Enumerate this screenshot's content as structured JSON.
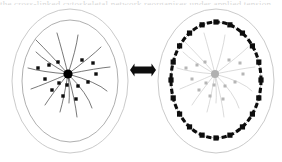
{
  "figure": {
    "caption_sliver": "the cross-linked cytoskeletal network reorganises under applied tension",
    "arrow": {
      "name": "bidirectional-arrow",
      "label": "reversible transition",
      "direction": "both",
      "cx": 143,
      "cy": 70,
      "length": 26,
      "thickness": 7
    },
    "colors": {
      "background": "#ffffff",
      "outline": "#9a9a9a",
      "outline_faint": "#bdbdbd",
      "node": "#0d0d0d",
      "node_faded": "#b6b6b6",
      "spoke": "#4c4c4c",
      "spoke_faded": "#cfcfcf",
      "ring": "#0d0d0d",
      "arrow": "#0d0d0d"
    },
    "panels": [
      {
        "id": "panel-left",
        "name": "centralized-state-panel",
        "state_label": "centralized",
        "outer_ellipse": {
          "cx": 70,
          "cy": 81,
          "rx": 58,
          "ry": 72
        },
        "inner_ellipse": {
          "cx": 70,
          "cy": 81,
          "rx": 48,
          "ry": 61
        },
        "hub": {
          "cx": 68,
          "cy": 74,
          "r": 4.6,
          "faded": false
        },
        "node_size": 3.4,
        "node_faded": false,
        "spoke_faded": false,
        "nodes": [
          {
            "x": 38,
            "y": 68
          },
          {
            "x": 49,
            "y": 65
          },
          {
            "x": 58,
            "y": 62
          },
          {
            "x": 82,
            "y": 60
          },
          {
            "x": 93,
            "y": 63
          },
          {
            "x": 96,
            "y": 74
          },
          {
            "x": 88,
            "y": 82
          },
          {
            "x": 78,
            "y": 86
          },
          {
            "x": 67,
            "y": 85
          },
          {
            "x": 59,
            "y": 83
          },
          {
            "x": 52,
            "y": 90
          },
          {
            "x": 63,
            "y": 96
          },
          {
            "x": 76,
            "y": 99
          },
          {
            "x": 45,
            "y": 79
          }
        ],
        "spokes": [
          {
            "x1": 68,
            "y1": 74,
            "cx": 50,
            "cy": 54,
            "x2": 36,
            "y2": 40
          },
          {
            "x1": 68,
            "y1": 74,
            "cx": 62,
            "cy": 50,
            "x2": 57,
            "y2": 33
          },
          {
            "x1": 68,
            "y1": 74,
            "cx": 76,
            "cy": 50,
            "x2": 78,
            "y2": 35
          },
          {
            "x1": 68,
            "y1": 74,
            "cx": 92,
            "cy": 56,
            "x2": 101,
            "y2": 47
          },
          {
            "x1": 68,
            "y1": 74,
            "cx": 98,
            "cy": 68,
            "x2": 110,
            "y2": 67
          },
          {
            "x1": 68,
            "y1": 74,
            "cx": 97,
            "cy": 82,
            "x2": 107,
            "y2": 91
          },
          {
            "x1": 68,
            "y1": 74,
            "cx": 88,
            "cy": 94,
            "x2": 92,
            "y2": 108
          },
          {
            "x1": 68,
            "y1": 74,
            "cx": 75,
            "cy": 100,
            "x2": 77,
            "y2": 117
          },
          {
            "x1": 68,
            "y1": 74,
            "cx": 64,
            "cy": 98,
            "x2": 60,
            "y2": 112
          },
          {
            "x1": 68,
            "y1": 74,
            "cx": 52,
            "cy": 94,
            "x2": 45,
            "y2": 105
          },
          {
            "x1": 68,
            "y1": 74,
            "cx": 45,
            "cy": 84,
            "x2": 31,
            "y2": 89
          },
          {
            "x1": 68,
            "y1": 74,
            "cx": 42,
            "cy": 72,
            "x2": 28,
            "y2": 68
          },
          {
            "x1": 68,
            "y1": 74,
            "cx": 46,
            "cy": 62,
            "x2": 36,
            "y2": 52
          },
          {
            "x1": 68,
            "y1": 74,
            "cx": 70,
            "cy": 92,
            "x2": 69,
            "y2": 103
          }
        ]
      },
      {
        "id": "panel-right",
        "name": "cortical-ring-state-panel",
        "state_label": "peripheral ring",
        "outer_ellipse": {
          "cx": 216,
          "cy": 81,
          "rx": 58,
          "ry": 72
        },
        "inner_ellipse": {
          "cx": 216,
          "cy": 80,
          "rx": 45,
          "ry": 58
        },
        "hub": {
          "cx": 215,
          "cy": 74,
          "r": 4.0,
          "faded": true
        },
        "node_size": 3.0,
        "node_faded": true,
        "spoke_faded": true,
        "ring": {
          "cx": 216,
          "cy": 80,
          "rx": 45,
          "ry": 58,
          "node_count": 20,
          "node_size": 5.2
        },
        "nodes": [
          {
            "x": 186,
            "y": 68
          },
          {
            "x": 197,
            "y": 65
          },
          {
            "x": 205,
            "y": 62
          },
          {
            "x": 229,
            "y": 60
          },
          {
            "x": 240,
            "y": 63
          },
          {
            "x": 243,
            "y": 74
          },
          {
            "x": 235,
            "y": 82
          },
          {
            "x": 225,
            "y": 86
          },
          {
            "x": 214,
            "y": 85
          },
          {
            "x": 206,
            "y": 83
          },
          {
            "x": 199,
            "y": 90
          },
          {
            "x": 210,
            "y": 96
          },
          {
            "x": 223,
            "y": 99
          },
          {
            "x": 192,
            "y": 79
          }
        ],
        "spokes": [
          {
            "x1": 215,
            "y1": 74,
            "cx": 197,
            "cy": 54,
            "x2": 183,
            "y2": 40
          },
          {
            "x1": 215,
            "y1": 74,
            "cx": 209,
            "cy": 50,
            "x2": 204,
            "y2": 33
          },
          {
            "x1": 215,
            "y1": 74,
            "cx": 223,
            "cy": 50,
            "x2": 225,
            "y2": 35
          },
          {
            "x1": 215,
            "y1": 74,
            "cx": 239,
            "cy": 56,
            "x2": 248,
            "y2": 47
          },
          {
            "x1": 215,
            "y1": 74,
            "cx": 245,
            "cy": 68,
            "x2": 255,
            "y2": 67
          },
          {
            "x1": 215,
            "y1": 74,
            "cx": 244,
            "cy": 82,
            "x2": 252,
            "y2": 91
          },
          {
            "x1": 215,
            "y1": 74,
            "cx": 235,
            "cy": 94,
            "x2": 239,
            "y2": 108
          },
          {
            "x1": 215,
            "y1": 74,
            "cx": 222,
            "cy": 100,
            "x2": 224,
            "y2": 117
          },
          {
            "x1": 215,
            "y1": 74,
            "cx": 211,
            "cy": 98,
            "x2": 207,
            "y2": 112
          },
          {
            "x1": 215,
            "y1": 74,
            "cx": 199,
            "cy": 94,
            "x2": 192,
            "y2": 105
          },
          {
            "x1": 215,
            "y1": 74,
            "cx": 192,
            "cy": 84,
            "x2": 180,
            "y2": 89
          },
          {
            "x1": 215,
            "y1": 74,
            "cx": 189,
            "cy": 72,
            "x2": 177,
            "y2": 68
          },
          {
            "x1": 215,
            "y1": 74,
            "cx": 193,
            "cy": 62,
            "x2": 183,
            "y2": 52
          },
          {
            "x1": 215,
            "y1": 74,
            "cx": 217,
            "cy": 92,
            "x2": 216,
            "y2": 103
          }
        ]
      }
    ]
  }
}
